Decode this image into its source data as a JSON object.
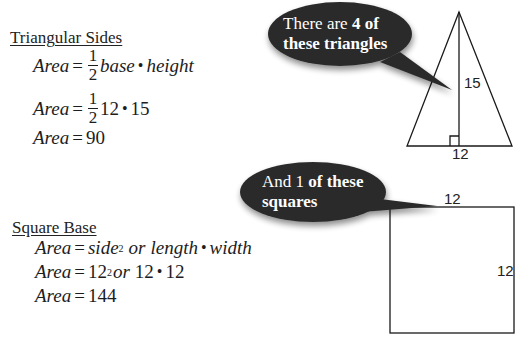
{
  "triangular_sides": {
    "heading": "Triangular Sides",
    "eq1": {
      "lhs": "Area",
      "eq": "=",
      "num": "1",
      "den": "2",
      "rhs_a": "base",
      "dot": "•",
      "rhs_b": "height"
    },
    "eq2": {
      "lhs": "Area",
      "eq": "=",
      "num": "1",
      "den": "2",
      "rhs_a": "12",
      "dot": "•",
      "rhs_b": "15"
    },
    "eq3": {
      "lhs": "Area",
      "eq": "=",
      "rhs": "90"
    }
  },
  "square_base": {
    "heading": "Square Base",
    "eq1": {
      "lhs": "Area",
      "eq": "=",
      "side": "side",
      "exp": "2",
      "or": "or",
      "length": "length",
      "dot": "•",
      "width": "width"
    },
    "eq2": {
      "lhs": "Area",
      "eq": "=",
      "base": "12",
      "exp": "2",
      "or": "or",
      "a": "12",
      "dot": "•",
      "b": "12"
    },
    "eq3": {
      "lhs": "Area",
      "eq": "=",
      "rhs": "144"
    }
  },
  "bubble_triangles": {
    "line1_plain": "There are ",
    "line1_bold": "4 of",
    "line2_bold": "these triangles"
  },
  "bubble_squares": {
    "line1_plain": "And 1 ",
    "line1_bold": "of these",
    "line2_bold": "squares"
  },
  "triangle_figure": {
    "height_label": "15",
    "base_label": "12"
  },
  "square_figure": {
    "top_label": "12",
    "side_label": "12"
  },
  "colors": {
    "bubble_fill": "#2b2b2b",
    "text": "#1d1d1d",
    "background": "#ffffff"
  }
}
